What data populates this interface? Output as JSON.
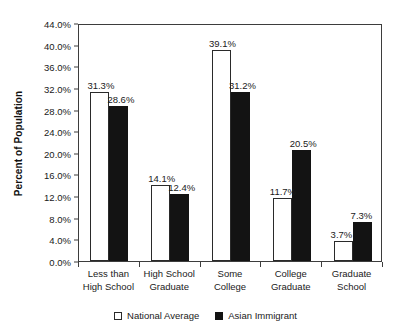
{
  "chart_data": {
    "type": "bar",
    "title": "",
    "xlabel": "",
    "ylabel": "Percent of Population",
    "ylim": [
      0,
      44
    ],
    "ytick_step": 4,
    "ytick_labels": [
      "44.0%",
      "40.0%",
      "36.0%",
      "32.0%",
      "28.0%",
      "24.0%",
      "20.0%",
      "16.0%",
      "12.0%",
      "8.0%",
      "4.0%",
      "0.0%"
    ],
    "grid": false,
    "legend_position": "bottom-center",
    "categories": [
      {
        "line1": "Less than",
        "line2": "High School"
      },
      {
        "line1": "High School",
        "line2": "Graduate"
      },
      {
        "line1": "Some",
        "line2": "College"
      },
      {
        "line1": "College",
        "line2": "Graduate"
      },
      {
        "line1": "Graduate",
        "line2": "School"
      }
    ],
    "series": [
      {
        "name": "National Average",
        "color": "#ffffff",
        "values": [
          31.3,
          14.1,
          39.1,
          11.7,
          3.7
        ],
        "labels": [
          "31.3%",
          "14.1%",
          "39.1%",
          "11.7%",
          "3.7%"
        ]
      },
      {
        "name": "Asian Immigrant",
        "color": "#131313",
        "values": [
          28.6,
          12.4,
          31.2,
          20.5,
          7.3
        ],
        "labels": [
          "28.6%",
          "12.4%",
          "31.2%",
          "20.5%",
          "7.3%"
        ]
      }
    ]
  },
  "legend": {
    "items": [
      {
        "label": "National Average"
      },
      {
        "label": "Asian Immigrant"
      }
    ]
  }
}
